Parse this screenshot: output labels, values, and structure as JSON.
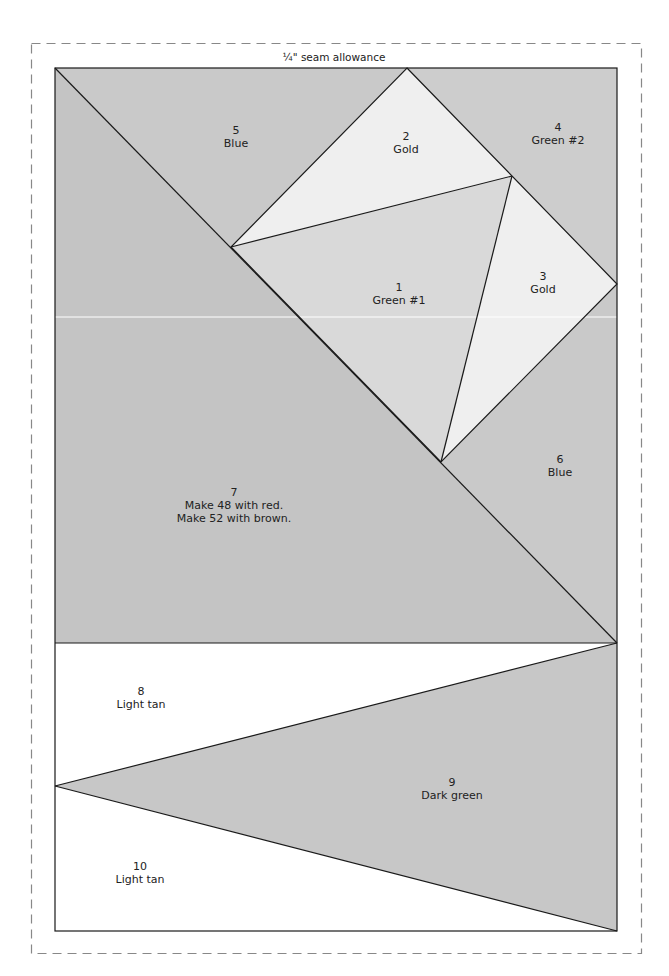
{
  "seam_allowance": {
    "label": "¼\" seam allowance"
  },
  "colors": {
    "medium_gray": "#c8c8c8",
    "green1_gray": "#d8d8d8",
    "gold_light": "#efefef",
    "light_tan_white": "#ffffff",
    "line": "#1a1a1a",
    "dash": "#888888"
  },
  "pieces": [
    {
      "number": "1",
      "name": "Green #1"
    },
    {
      "number": "2",
      "name": "Gold"
    },
    {
      "number": "3",
      "name": "Gold"
    },
    {
      "number": "4",
      "name": "Green #2"
    },
    {
      "number": "5",
      "name": "Blue"
    },
    {
      "number": "6",
      "name": "Blue"
    },
    {
      "number": "7",
      "line1": "Make 48 with red.",
      "line2": "Make 52 with brown."
    },
    {
      "number": "8",
      "name": "Light tan"
    },
    {
      "number": "9",
      "name": "Dark green"
    },
    {
      "number": "10",
      "name": "Light tan"
    }
  ]
}
